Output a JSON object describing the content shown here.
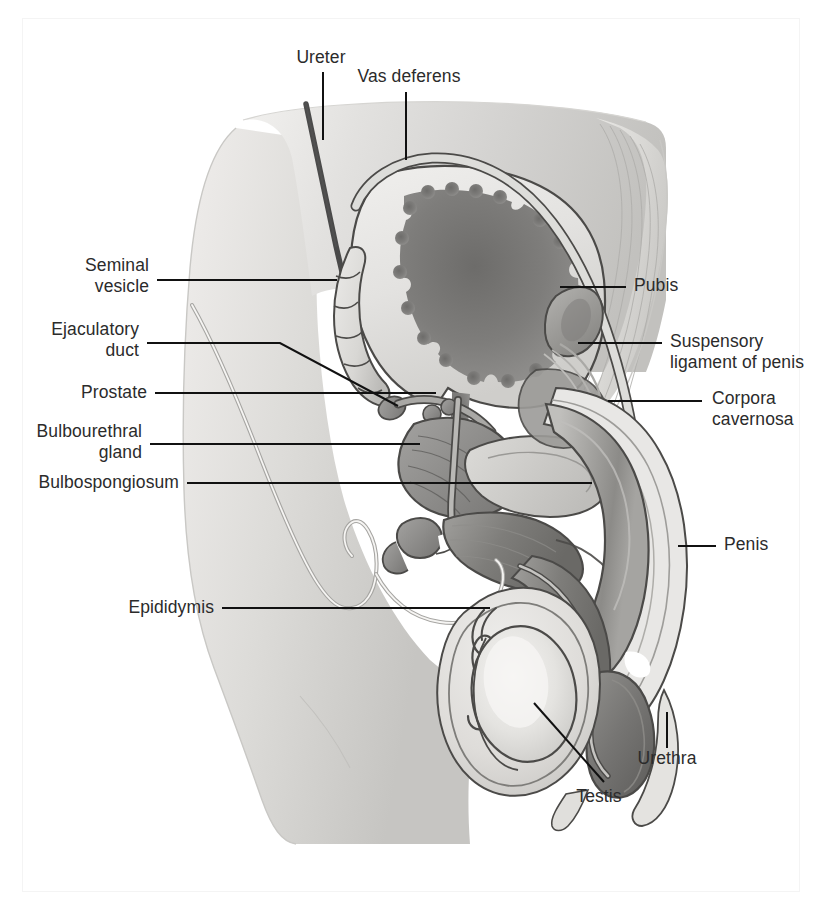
{
  "figure": {
    "type": "anatomical-illustration",
    "style": "grayscale-medical-diagram",
    "background_color": "#ffffff",
    "line_color": "#1a1a1a",
    "palette": {
      "skin_light": "#e9e8e6",
      "skin_mid": "#d6d5d3",
      "skin_shadow": "#bdbcb9",
      "tissue_mid": "#b4b3b1",
      "organ_dark": "#8d8c8a",
      "organ_darker": "#6f6e6c",
      "bladder_lumen": "#7a7977",
      "highlight": "#fbfbfa"
    },
    "labels": [
      {
        "id": "ureter",
        "text": "Ureter",
        "align": "c",
        "x": 297,
        "y": 47,
        "leader": "vertical"
      },
      {
        "id": "vas-deferens",
        "text": "Vas deferens",
        "align": "c",
        "x": 366,
        "y": 66,
        "leader": "vertical"
      },
      {
        "id": "seminal-vesicle",
        "text": "Seminal\nvesicle",
        "align": "r",
        "x": 40,
        "y": 256,
        "leader": "horizontal"
      },
      {
        "id": "ejaculatory-duct",
        "text": "Ejaculatory\nduct",
        "align": "r",
        "x": 27,
        "y": 320,
        "leader": "bent"
      },
      {
        "id": "prostate",
        "text": "Prostate",
        "align": "r",
        "x": 66,
        "y": 373,
        "leader": "horizontal"
      },
      {
        "id": "bulbourethral-gland",
        "text": "Bulbourethral\ngland",
        "align": "r",
        "x": 14,
        "y": 420,
        "leader": "horizontal"
      },
      {
        "id": "bulbospongiosum",
        "text": "Bulbospongiosum",
        "align": "r",
        "x": 13,
        "y": 472,
        "leader": "horizontal"
      },
      {
        "id": "epididymis",
        "text": "Epididymis",
        "align": "r",
        "x": 93,
        "y": 598,
        "leader": "horizontal"
      },
      {
        "id": "pubis",
        "text": "Pubis",
        "align": "l",
        "x": 634,
        "y": 275,
        "leader": "horizontal"
      },
      {
        "id": "suspensory-ligament",
        "text": "Suspensory\nligament of penis",
        "align": "l",
        "x": 668,
        "y": 331,
        "leader": "horizontal"
      },
      {
        "id": "corpora-cavernosa",
        "text": "Corpora\ncavernosa",
        "align": "l",
        "x": 710,
        "y": 388,
        "leader": "horizontal"
      },
      {
        "id": "penis",
        "text": "Penis",
        "align": "l",
        "x": 722,
        "y": 533,
        "leader": "horizontal"
      },
      {
        "id": "urethra",
        "text": "Urethra",
        "align": "c",
        "x": 645,
        "y": 745,
        "leader": "vertical"
      },
      {
        "id": "testis",
        "text": "Testis",
        "align": "c",
        "x": 583,
        "y": 785,
        "leader": "diagonal"
      }
    ],
    "structures": [
      "urinary bladder",
      "ureter",
      "vas deferens",
      "seminal vesicle",
      "ejaculatory duct",
      "prostate gland",
      "bulbourethral gland",
      "bulbospongiosum",
      "epididymis",
      "testis",
      "scrotum",
      "pubis",
      "suspensory ligament of penis",
      "corpora cavernosa",
      "penis",
      "urethra",
      "glans penis",
      "rectum"
    ]
  }
}
